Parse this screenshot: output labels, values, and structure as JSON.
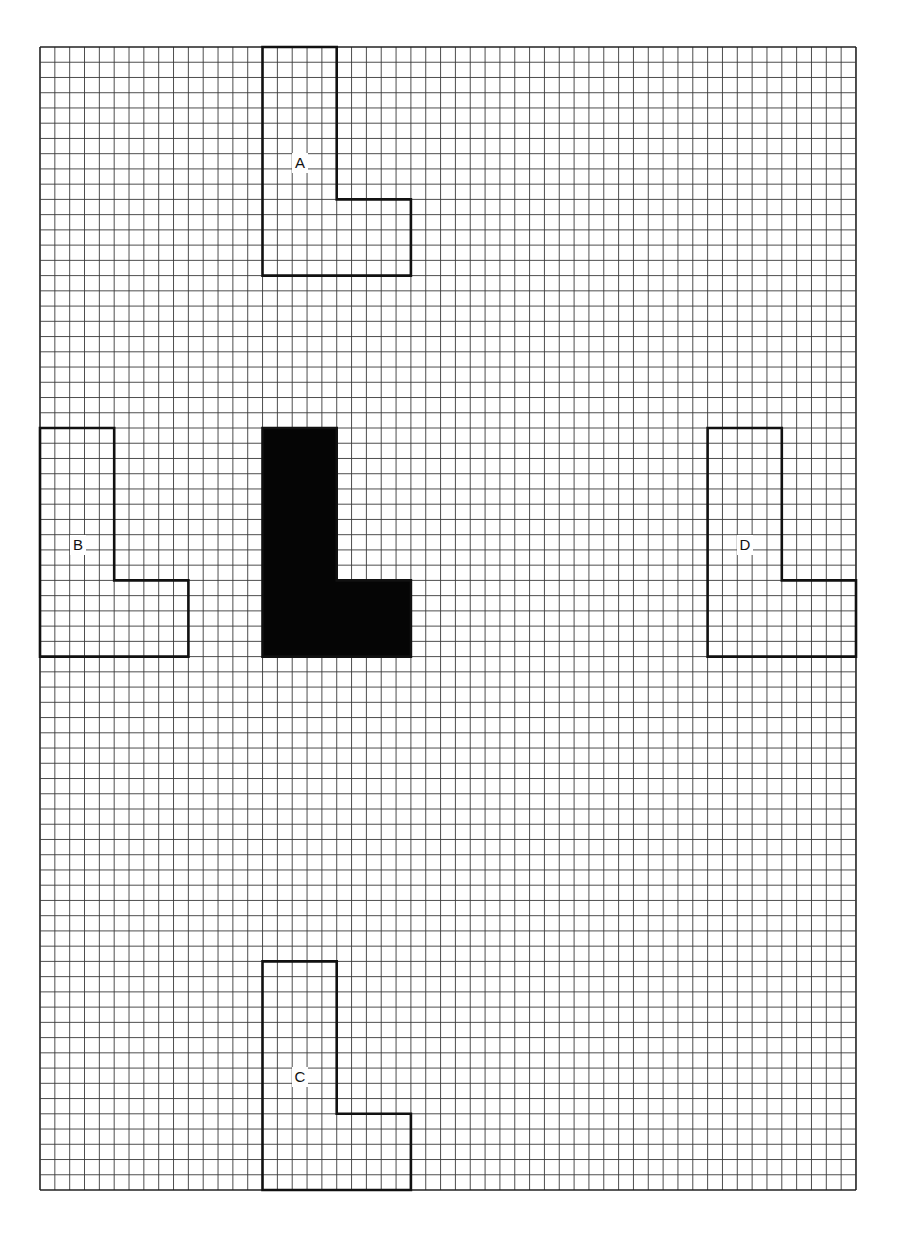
{
  "grid": {
    "origin_x": 40,
    "origin_y": 47,
    "cols": 55,
    "rows": 75,
    "cell_w": 14.836,
    "cell_h": 15.24,
    "line_color": "#3a3a3a",
    "border_color": "#222222"
  },
  "shape_outline": {
    "description": "L-shape: 10 cells wide x 15 cells tall, vertical bar 5 cells wide, foot 5 rows tall",
    "points": [
      [
        0,
        0
      ],
      [
        5,
        0
      ],
      [
        5,
        10
      ],
      [
        10,
        10
      ],
      [
        10,
        15
      ],
      [
        0,
        15
      ]
    ]
  },
  "shapes": [
    {
      "id": "A",
      "label": "A",
      "col": 15,
      "row": 0,
      "filled": false,
      "label_pos": [
        300,
        163
      ]
    },
    {
      "id": "B",
      "label": "B",
      "col": 0,
      "row": 25,
      "filled": false,
      "label_pos": [
        78,
        545
      ]
    },
    {
      "id": "original",
      "label": "",
      "col": 15,
      "row": 25,
      "filled": true,
      "label_pos": null
    },
    {
      "id": "D",
      "label": "D",
      "col": 45,
      "row": 25,
      "filled": false,
      "label_pos": [
        745,
        545
      ]
    },
    {
      "id": "C",
      "label": "C",
      "col": 15,
      "row": 60,
      "filled": false,
      "label_pos": [
        300,
        1077
      ]
    }
  ],
  "colors": {
    "fill": "#050505",
    "outline": "#111111",
    "background": "#ffffff"
  }
}
